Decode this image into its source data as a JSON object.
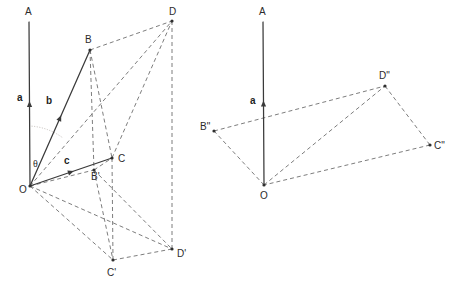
{
  "figure": {
    "width": 451,
    "height": 284,
    "background": "#ffffff",
    "colors": {
      "solid_stroke": "#3a3a3a",
      "dashed_stroke": "#6e6e6e",
      "dotted_arc": "#b9b2ae",
      "label_text": "#2b2b2b",
      "vertex_dot": "#2f2f2f"
    }
  },
  "left_diagram": {
    "name": "parallelepiped",
    "points": {
      "O": {
        "label": "O",
        "x": 30,
        "y": 186,
        "label_x": 19,
        "label_y": 193
      },
      "A": {
        "label": "A",
        "x": 29,
        "y": 22,
        "label_x": 25,
        "label_y": 15
      },
      "B": {
        "label": "B",
        "x": 90,
        "y": 50,
        "label_x": 85,
        "label_y": 43
      },
      "C": {
        "label": "C",
        "x": 112,
        "y": 158,
        "label_x": 118,
        "label_y": 162
      },
      "D": {
        "label": "D",
        "x": 172,
        "y": 21,
        "label_x": 169,
        "label_y": 15
      },
      "Bp": {
        "label": "B'",
        "x": 94,
        "y": 170,
        "label_x": 91,
        "label_y": 180
      },
      "Cp": {
        "label": "C'",
        "x": 113,
        "y": 260,
        "label_x": 107,
        "label_y": 276
      },
      "Dp": {
        "label": "D'",
        "x": 172,
        "y": 249,
        "label_x": 177,
        "label_y": 257
      }
    },
    "vectors": [
      {
        "name": "a",
        "label": "a",
        "from": "O",
        "to": "A",
        "label_x": 17,
        "label_y": 101,
        "style": "solid"
      },
      {
        "name": "b",
        "label": "b",
        "from": "O",
        "to": "B",
        "label_x": 46,
        "label_y": 104,
        "style": "solid"
      },
      {
        "name": "c",
        "label": "c",
        "from": "O",
        "to": "C",
        "label_x": 64,
        "label_y": 164,
        "style": "solid"
      }
    ],
    "angle": {
      "label": "θ",
      "label_x": 33,
      "label_y": 167
    },
    "dashed_edges": [
      [
        "B",
        "D"
      ],
      [
        "B",
        "Bp"
      ],
      [
        "D",
        "Dp"
      ],
      [
        "C",
        "Cp"
      ],
      [
        "Bp",
        "Cp"
      ],
      [
        "O",
        "D"
      ],
      [
        "O",
        "Bp"
      ],
      [
        "O",
        "Cp"
      ],
      [
        "O",
        "Dp"
      ],
      [
        "C",
        "D"
      ],
      [
        "Cp",
        "Dp"
      ],
      [
        "Bp",
        "C"
      ],
      [
        "Bp",
        "Dp"
      ],
      [
        "B",
        "C"
      ]
    ]
  },
  "right_diagram": {
    "name": "projected-base",
    "points": {
      "O": {
        "label": "O",
        "x": 264,
        "y": 185,
        "label_x": 260,
        "label_y": 199
      },
      "A": {
        "label": "A",
        "x": 263,
        "y": 22,
        "label_x": 259,
        "label_y": 15
      },
      "Bpp": {
        "label": "B\"",
        "x": 214,
        "y": 131,
        "label_x": 200,
        "label_y": 130
      },
      "Cpp": {
        "label": "C\"",
        "x": 430,
        "y": 145,
        "label_x": 434,
        "label_y": 149
      },
      "Dpp": {
        "label": "D\"",
        "x": 385,
        "y": 86,
        "label_x": 379,
        "label_y": 79
      }
    },
    "vectors": [
      {
        "name": "a",
        "label": "a",
        "from": "O",
        "to": "A",
        "label_x": 250,
        "label_y": 104,
        "style": "solid"
      }
    ],
    "dashed_edges": [
      [
        "O",
        "Bpp"
      ],
      [
        "Bpp",
        "Dpp"
      ],
      [
        "Dpp",
        "Cpp"
      ],
      [
        "Cpp",
        "O"
      ],
      [
        "O",
        "Dpp"
      ]
    ]
  }
}
